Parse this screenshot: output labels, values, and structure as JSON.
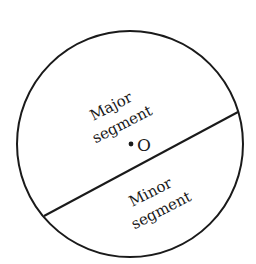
{
  "diagram": {
    "labels": {
      "major_line1": "Major",
      "major_line2": "segment",
      "minor_line1": "Minor",
      "minor_line2": "segment",
      "center": "O"
    },
    "colors": {
      "stroke": "#1a1a1a",
      "background": "#ffffff"
    }
  }
}
